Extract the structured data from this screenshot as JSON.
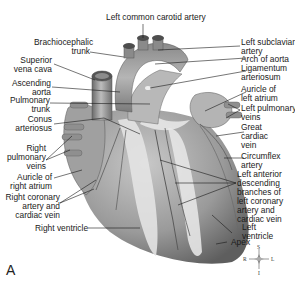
{
  "figure": {
    "panel_letter": "A"
  },
  "labels_top": {
    "left_common_carotid": "Left common carotid artery"
  },
  "labels_left": {
    "brachiocephalic_1": "Brachiocephalic",
    "brachiocephalic_2": "trunk",
    "svc_1": "Superior",
    "svc_2": "vena cava",
    "asc_aorta_1": "Ascending",
    "asc_aorta_2": "aorta",
    "pulm_trunk_1": "Pulmonary",
    "pulm_trunk_2": "trunk",
    "conus_1": "Conus",
    "conus_2": "arteriosus",
    "rpv_1": "Right",
    "rpv_2": "pulmonary",
    "rpv_3": "veins",
    "ra_auricle_1": "Auricle of",
    "ra_auricle_2": "right atrium",
    "rca_1": "Right coronary",
    "rca_2": "artery and",
    "rca_3": "cardiac vein",
    "rv": "Right ventricle"
  },
  "labels_right": {
    "lsa_1": "Left subclavian",
    "lsa_2": "artery",
    "arch": "Arch of aorta",
    "lig_1": "Ligamentum",
    "lig_2": "arteriosum",
    "la_auricle_1": "Auricle of",
    "la_auricle_2": "left atrium",
    "lpv_1": "Left pulmonary",
    "lpv_2": "veins",
    "gcv_1": "Great",
    "gcv_2": "cardiac",
    "gcv_3": "vein",
    "circ_1": "Circumflex",
    "circ_2": "artery",
    "lad_1": "Left anterior",
    "lad_2": "descending",
    "lad_3": "branches of",
    "lad_4": "left coronary",
    "lad_5": "artery and",
    "lad_6": "cardiac vein",
    "lv_1": "Left",
    "lv_2": "ventricle",
    "apex": "Apex"
  },
  "compass": {
    "north": "S",
    "south": "I",
    "west": "R",
    "east": "L"
  },
  "colors": {
    "line": "#1a1a1a",
    "heart_dark": "#6e6e6e",
    "heart_mid": "#a9a9a9",
    "heart_light": "#d8d8d8",
    "fat": "#e6e6e6"
  }
}
